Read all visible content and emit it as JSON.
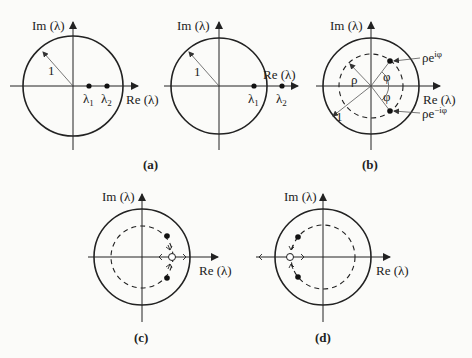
{
  "figure": {
    "panels": [
      {
        "id": "a1",
        "axis_im": "Im (λ)",
        "axis_re": "Re (λ)",
        "radius_label": "1",
        "points": [
          {
            "label": "λ",
            "sub": "1"
          },
          {
            "label": "λ",
            "sub": "2"
          }
        ]
      },
      {
        "id": "a2",
        "axis_im": "Im (λ)",
        "axis_re": "Re (λ)",
        "radius_label": "1",
        "points": [
          {
            "label": "λ",
            "sub": "1"
          },
          {
            "label": "λ",
            "sub": "2"
          }
        ]
      },
      {
        "id": "b",
        "axis_im": "Im (λ)",
        "axis_re": "Re (λ)",
        "radius_label": "1",
        "rho": "ρ",
        "phi": "φ",
        "upper_point": "ρe",
        "upper_exp": "iφ",
        "lower_point": "ρe",
        "lower_exp": "−iφ"
      },
      {
        "id": "c",
        "axis_im": "Im (λ)",
        "axis_re": "Re (λ)"
      },
      {
        "id": "d",
        "axis_im": "Im (λ)",
        "axis_re": "Re (λ)"
      }
    ],
    "captions": {
      "a": "(a)",
      "b": "(b)",
      "c": "(c)",
      "d": "(d)"
    }
  }
}
